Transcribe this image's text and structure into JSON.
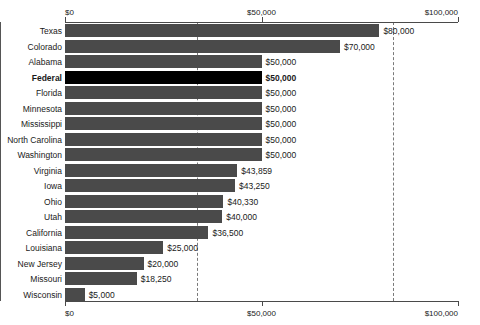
{
  "chart_data": {
    "type": "bar",
    "orientation": "horizontal",
    "title": "",
    "xlabel": "",
    "ylabel": "",
    "xlim": [
      0,
      100000
    ],
    "grid": true,
    "legend": null,
    "axis_ticks": [
      {
        "value": 0,
        "label": "$0"
      },
      {
        "value": 50000,
        "label": "$50,000"
      },
      {
        "value": 100000,
        "label": "$100,000"
      }
    ],
    "categories": [
      "Texas",
      "Colorado",
      "Alabama",
      "Federal",
      "Florida",
      "Minnesota",
      "Mississippi",
      "North Carolina",
      "Washington",
      "Virginia",
      "Iowa",
      "Ohio",
      "Utah",
      "California",
      "Louisiana",
      "New Jersey",
      "Missouri",
      "Wisconsin"
    ],
    "values": [
      80000,
      70000,
      50000,
      50000,
      50000,
      50000,
      50000,
      50000,
      50000,
      43859,
      43250,
      40330,
      40000,
      36500,
      25000,
      20000,
      18250,
      5000
    ],
    "value_labels": [
      "$80,000",
      "$70,000",
      "$50,000",
      "$50,000",
      "$50,000",
      "$50,000",
      "$50,000",
      "$50,000",
      "$50,000",
      "$43,859",
      "$43,250",
      "$40,330",
      "$40,000",
      "$36,500",
      "$25,000",
      "$20,000",
      "$18,250",
      "$5,000"
    ],
    "highlight_category": "Federal",
    "colors": {
      "bar": "#4a4a4a",
      "bar_highlight": "#000000",
      "axis": "#4a4a4a",
      "gridline": "#7a7a7a",
      "text": "#1a1a1a",
      "background": "#ffffff"
    }
  }
}
